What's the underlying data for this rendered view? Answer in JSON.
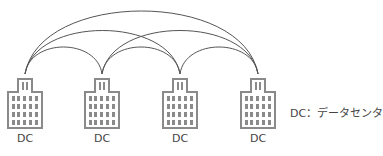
{
  "diagram": {
    "type": "full-mesh network of data centers",
    "nodes": [
      {
        "id": "dc1",
        "label": "DC",
        "x": 25
      },
      {
        "id": "dc2",
        "label": "DC",
        "x": 102
      },
      {
        "id": "dc3",
        "label": "DC",
        "x": 180
      },
      {
        "id": "dc4",
        "label": "DC",
        "x": 258
      }
    ],
    "edges": [
      [
        "dc1",
        "dc2"
      ],
      [
        "dc2",
        "dc3"
      ],
      [
        "dc3",
        "dc4"
      ],
      [
        "dc1",
        "dc3"
      ],
      [
        "dc2",
        "dc4"
      ],
      [
        "dc1",
        "dc4"
      ]
    ],
    "legend": "DC：データセンタ",
    "colors": {
      "line": "#555555",
      "building": "#8a8a8a",
      "text": "#444444"
    }
  }
}
